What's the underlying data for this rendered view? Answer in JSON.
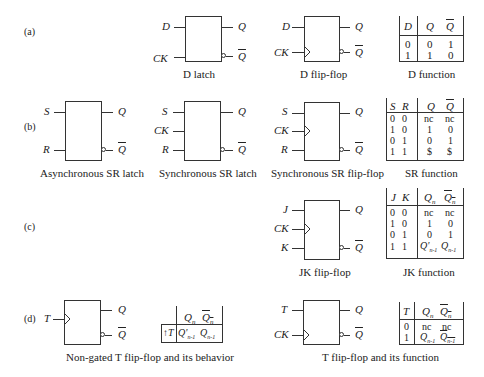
{
  "parts": {
    "a": "(a)",
    "b": "(b)",
    "c": "(c)",
    "d": "(d)"
  },
  "signals": {
    "D": "D",
    "CK": "CK",
    "S": "S",
    "R": "R",
    "J": "J",
    "K": "K",
    "T": "T",
    "Q": "Q",
    "Qbar": "Q"
  },
  "captions": {
    "d_latch": "D latch",
    "d_ff": "D flip-flop",
    "d_func": "D function",
    "async_sr": "Asynchronous SR latch",
    "sync_sr_latch": "Synchronous SR latch",
    "sync_sr_ff": "Synchronous SR flip-flop",
    "sr_func": "SR function",
    "jk_ff": "JK flip-flop",
    "jk_func": "JK function",
    "t_nongated": "Non-gated T flip-flop and its  behavior",
    "t_ff": "T flip-flop and its  function"
  },
  "tables": {
    "d": {
      "headers": [
        "D",
        "Q",
        "Q"
      ],
      "rows": [
        [
          "0",
          "0",
          "1"
        ],
        [
          "1",
          "1",
          "0"
        ]
      ]
    },
    "sr": {
      "headers": [
        "S",
        "R",
        "Q",
        "Q"
      ],
      "rows": [
        [
          "0",
          "0",
          "nc",
          "nc"
        ],
        [
          "1",
          "0",
          "1",
          "0"
        ],
        [
          "0",
          "1",
          "0",
          "1"
        ],
        [
          "1",
          "1",
          "$",
          "$"
        ]
      ]
    },
    "jk": {
      "headers": [
        "J",
        "K",
        "Qn",
        "Qn"
      ],
      "rows": [
        [
          "0",
          "0",
          "nc",
          "nc"
        ],
        [
          "1",
          "0",
          "1",
          "0"
        ],
        [
          "0",
          "1",
          "0",
          "1"
        ],
        [
          "1",
          "1",
          "Q'n-1",
          "Qn-1"
        ]
      ]
    },
    "t_behavior": {
      "headers": [
        "",
        "Qn",
        "Qn"
      ],
      "rows": [
        [
          "↑T",
          "Q'n-1",
          "Qn-1"
        ]
      ]
    },
    "t": {
      "headers": [
        "T",
        "Qn",
        "Qn"
      ],
      "rows": [
        [
          "0",
          "nc",
          "nc"
        ],
        [
          "1",
          "Qn-1",
          "Qn-1"
        ]
      ]
    }
  }
}
